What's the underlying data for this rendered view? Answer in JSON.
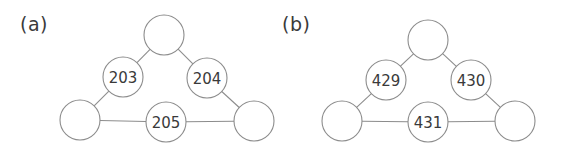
{
  "figure": {
    "background_color": "#ffffff",
    "stroke_color": "#8c8c8c",
    "text_color": "#3a3a3a",
    "node_fill_color": "#ffffff",
    "panels": [
      {
        "id": "a",
        "label": "(a)",
        "label_x": 20,
        "label_y": 13,
        "nodes": [
          {
            "id": "a-top",
            "label": "",
            "cx": 164,
            "cy": 35,
            "r": 20
          },
          {
            "id": "a-left-mid",
            "label": "203",
            "cx": 123,
            "cy": 77,
            "r": 20
          },
          {
            "id": "a-right-mid",
            "label": "204",
            "cx": 207,
            "cy": 78,
            "r": 20
          },
          {
            "id": "a-bottom-left",
            "label": "",
            "cx": 80,
            "cy": 120,
            "r": 20
          },
          {
            "id": "a-bottom-mid",
            "label": "205",
            "cx": 166,
            "cy": 122,
            "r": 20
          },
          {
            "id": "a-bottom-right",
            "label": "",
            "cx": 254,
            "cy": 121,
            "r": 20
          }
        ],
        "edges": [
          {
            "from": "a-left-mid",
            "to": "a-top"
          },
          {
            "from": "a-top",
            "to": "a-right-mid"
          },
          {
            "from": "a-bottom-left",
            "to": "a-left-mid"
          },
          {
            "from": "a-right-mid",
            "to": "a-bottom-right"
          },
          {
            "from": "a-bottom-left",
            "to": "a-bottom-mid"
          },
          {
            "from": "a-bottom-mid",
            "to": "a-bottom-right"
          }
        ]
      },
      {
        "id": "b",
        "label": "(b)",
        "label_x": 282,
        "label_y": 13,
        "nodes": [
          {
            "id": "b-top",
            "label": "",
            "cx": 428,
            "cy": 40,
            "r": 20
          },
          {
            "id": "b-left-mid",
            "label": "429",
            "cx": 386,
            "cy": 80,
            "r": 20
          },
          {
            "id": "b-right-mid",
            "label": "430",
            "cx": 471,
            "cy": 80,
            "r": 20
          },
          {
            "id": "b-bottom-left",
            "label": "",
            "cx": 342,
            "cy": 121,
            "r": 20
          },
          {
            "id": "b-bottom-mid",
            "label": "431",
            "cx": 428,
            "cy": 122,
            "r": 20
          },
          {
            "id": "b-bottom-right",
            "label": "",
            "cx": 515,
            "cy": 121,
            "r": 20
          }
        ],
        "edges": [
          {
            "from": "b-left-mid",
            "to": "b-top"
          },
          {
            "from": "b-top",
            "to": "b-right-mid"
          },
          {
            "from": "b-bottom-left",
            "to": "b-left-mid"
          },
          {
            "from": "b-right-mid",
            "to": "b-bottom-right"
          },
          {
            "from": "b-bottom-left",
            "to": "b-bottom-mid"
          },
          {
            "from": "b-bottom-mid",
            "to": "b-bottom-right"
          }
        ]
      }
    ]
  }
}
